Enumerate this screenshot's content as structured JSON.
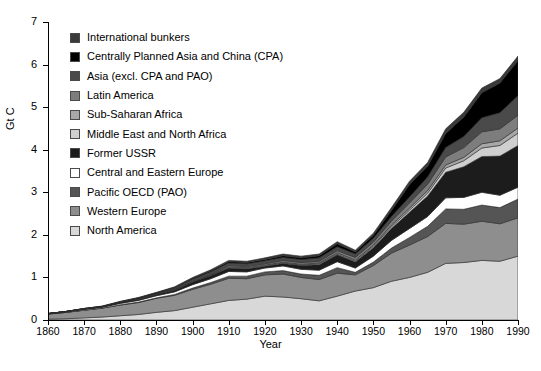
{
  "figure": {
    "caption": ""
  },
  "axes": {
    "ylabel": "Gt C",
    "xlabel": "Year",
    "ytick_labels": [
      "0",
      "1",
      "2",
      "3",
      "4",
      "5",
      "6",
      "7"
    ],
    "xtick_labels": [
      "1860",
      "1870",
      "1880",
      "1890",
      "1900",
      "1910",
      "1920",
      "1930",
      "1940",
      "1950",
      "1960",
      "1970",
      "1980",
      "1990"
    ]
  },
  "legend": {
    "items": [
      {
        "label": "International bunkers",
        "color": "#3a3a3a"
      },
      {
        "label": "Centrally Planned Asia and China (CPA)",
        "color": "#000000"
      },
      {
        "label": "Asia (excl. CPA and PAO)",
        "color": "#4a4a4a"
      },
      {
        "label": "Latin America",
        "color": "#7d7d7d"
      },
      {
        "label": "Sub-Saharan Africa",
        "color": "#a8a8a8"
      },
      {
        "label": "Middle East and North Africa",
        "color": "#cfcfcf"
      },
      {
        "label": "Former USSR",
        "color": "#1c1c1c"
      },
      {
        "label": "Central and Eastern Europe",
        "color": "#ffffff"
      },
      {
        "label": "Pacific OECD (PAO)",
        "color": "#555555"
      },
      {
        "label": "Western Europe",
        "color": "#8e8e8e"
      },
      {
        "label": "North America",
        "color": "#d8d8d8"
      }
    ]
  },
  "chart_data": {
    "type": "area",
    "title": "",
    "subtitle": "",
    "xlabel": "Year",
    "ylabel": "Gt C",
    "xlim": [
      1860,
      1990
    ],
    "ylim": [
      0,
      7
    ],
    "grid": false,
    "legend_position": "upper-left-inside",
    "stacked": true,
    "stack_order_bottom_to_top": [
      "North America",
      "Western Europe",
      "Pacific OECD (PAO)",
      "Central and Eastern Europe",
      "Former USSR",
      "Middle East and North Africa",
      "Sub-Saharan Africa",
      "Latin America",
      "Asia (excl. CPA and PAO)",
      "Centrally Planned Asia and China (CPA)",
      "International bunkers"
    ],
    "x": [
      1860,
      1865,
      1870,
      1875,
      1880,
      1885,
      1890,
      1895,
      1900,
      1905,
      1910,
      1915,
      1920,
      1925,
      1930,
      1935,
      1940,
      1945,
      1950,
      1955,
      1960,
      1965,
      1970,
      1975,
      1980,
      1985,
      1990
    ],
    "series": [
      {
        "name": "North America",
        "color": "#d8d8d8",
        "values": [
          0.02,
          0.03,
          0.05,
          0.07,
          0.1,
          0.13,
          0.18,
          0.22,
          0.3,
          0.38,
          0.46,
          0.49,
          0.56,
          0.54,
          0.5,
          0.45,
          0.56,
          0.68,
          0.76,
          0.91,
          1.0,
          1.12,
          1.33,
          1.35,
          1.4,
          1.38,
          1.5
        ]
      },
      {
        "name": "Western Europe",
        "color": "#8e8e8e",
        "values": [
          0.12,
          0.15,
          0.18,
          0.21,
          0.25,
          0.28,
          0.33,
          0.36,
          0.42,
          0.46,
          0.52,
          0.48,
          0.5,
          0.54,
          0.5,
          0.5,
          0.54,
          0.38,
          0.52,
          0.66,
          0.76,
          0.84,
          0.94,
          0.9,
          0.92,
          0.88,
          0.9
        ]
      },
      {
        "name": "Pacific OECD (PAO)",
        "color": "#555555",
        "values": [
          0.0,
          0.0,
          0.0,
          0.0,
          0.01,
          0.01,
          0.01,
          0.02,
          0.03,
          0.04,
          0.05,
          0.06,
          0.07,
          0.08,
          0.08,
          0.1,
          0.13,
          0.06,
          0.08,
          0.12,
          0.18,
          0.24,
          0.34,
          0.35,
          0.38,
          0.38,
          0.44
        ]
      },
      {
        "name": "Central and Eastern Europe",
        "color": "#ffffff",
        "values": [
          0.01,
          0.01,
          0.02,
          0.02,
          0.03,
          0.04,
          0.05,
          0.06,
          0.08,
          0.09,
          0.11,
          0.1,
          0.09,
          0.11,
          0.11,
          0.12,
          0.14,
          0.1,
          0.14,
          0.18,
          0.21,
          0.23,
          0.26,
          0.28,
          0.3,
          0.29,
          0.28
        ]
      },
      {
        "name": "Former USSR",
        "color": "#1c1c1c",
        "values": [
          0.0,
          0.01,
          0.01,
          0.01,
          0.02,
          0.02,
          0.03,
          0.04,
          0.06,
          0.07,
          0.08,
          0.07,
          0.04,
          0.06,
          0.09,
          0.13,
          0.16,
          0.14,
          0.2,
          0.28,
          0.38,
          0.48,
          0.6,
          0.72,
          0.84,
          0.92,
          0.98
        ]
      },
      {
        "name": "Middle East and North Africa",
        "color": "#cfcfcf",
        "values": [
          0.0,
          0.0,
          0.0,
          0.0,
          0.0,
          0.0,
          0.0,
          0.0,
          0.0,
          0.01,
          0.01,
          0.01,
          0.01,
          0.01,
          0.01,
          0.02,
          0.02,
          0.02,
          0.03,
          0.04,
          0.05,
          0.07,
          0.1,
          0.14,
          0.2,
          0.25,
          0.29
        ]
      },
      {
        "name": "Sub-Saharan Africa",
        "color": "#a8a8a8",
        "values": [
          0.0,
          0.0,
          0.0,
          0.0,
          0.0,
          0.0,
          0.0,
          0.01,
          0.01,
          0.01,
          0.02,
          0.02,
          0.02,
          0.02,
          0.02,
          0.02,
          0.03,
          0.03,
          0.03,
          0.04,
          0.05,
          0.06,
          0.07,
          0.08,
          0.1,
          0.11,
          0.12
        ]
      },
      {
        "name": "Latin America",
        "color": "#7d7d7d",
        "values": [
          0.0,
          0.0,
          0.0,
          0.0,
          0.0,
          0.01,
          0.01,
          0.01,
          0.02,
          0.02,
          0.03,
          0.03,
          0.03,
          0.04,
          0.04,
          0.04,
          0.05,
          0.06,
          0.07,
          0.09,
          0.12,
          0.15,
          0.19,
          0.23,
          0.28,
          0.28,
          0.3
        ]
      },
      {
        "name": "Asia (excl. CPA and PAO)",
        "color": "#4a4a4a",
        "values": [
          0.0,
          0.0,
          0.01,
          0.01,
          0.01,
          0.02,
          0.02,
          0.03,
          0.04,
          0.05,
          0.06,
          0.06,
          0.07,
          0.07,
          0.07,
          0.08,
          0.09,
          0.08,
          0.09,
          0.11,
          0.14,
          0.17,
          0.22,
          0.26,
          0.33,
          0.38,
          0.46
        ]
      },
      {
        "name": "Centrally Planned Asia and China (CPA)",
        "color": "#000000",
        "values": [
          0.0,
          0.0,
          0.0,
          0.0,
          0.01,
          0.01,
          0.01,
          0.01,
          0.02,
          0.02,
          0.03,
          0.03,
          0.03,
          0.04,
          0.04,
          0.05,
          0.07,
          0.05,
          0.07,
          0.14,
          0.29,
          0.25,
          0.33,
          0.46,
          0.59,
          0.7,
          0.82
        ]
      },
      {
        "name": "International bunkers",
        "color": "#3a3a3a",
        "values": [
          0.0,
          0.0,
          0.0,
          0.01,
          0.01,
          0.01,
          0.01,
          0.02,
          0.02,
          0.03,
          0.03,
          0.03,
          0.04,
          0.04,
          0.04,
          0.04,
          0.05,
          0.04,
          0.05,
          0.07,
          0.08,
          0.09,
          0.11,
          0.11,
          0.11,
          0.1,
          0.11
        ]
      }
    ],
    "total_by_year": [
      0.15,
      0.2,
      0.27,
      0.33,
      0.44,
      0.53,
      0.65,
      0.78,
      1.0,
      1.18,
      1.4,
      1.38,
      1.46,
      1.55,
      1.5,
      1.55,
      1.84,
      1.64,
      2.04,
      2.64,
      3.26,
      3.7,
      4.49,
      4.88,
      5.45,
      5.67,
      6.2
    ]
  }
}
